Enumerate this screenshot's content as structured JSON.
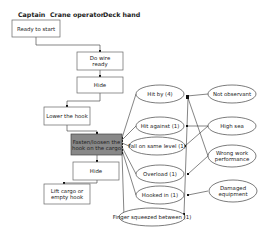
{
  "roles": [
    {
      "label": "Captain",
      "x": 18,
      "y": 17
    },
    {
      "label": "Crane operator",
      "x": 50,
      "y": 17
    },
    {
      "label": "Deck hand",
      "x": 103,
      "y": 17
    }
  ],
  "steps": [
    {
      "id": "ready",
      "lines": [
        "Ready to start"
      ],
      "x": 12,
      "y": 20,
      "w": 48,
      "h": 17,
      "dark": false
    },
    {
      "id": "wire",
      "lines": [
        "Do wire",
        "ready"
      ],
      "x": 77,
      "y": 52,
      "w": 46,
      "h": 18,
      "dark": false
    },
    {
      "id": "hide1",
      "lines": [
        "Hide"
      ],
      "x": 77,
      "y": 77,
      "w": 46,
      "h": 16,
      "dark": false
    },
    {
      "id": "lower",
      "lines": [
        "Lower the hook"
      ],
      "x": 44,
      "y": 107,
      "w": 46,
      "h": 18,
      "dark": false
    },
    {
      "id": "fasten",
      "lines": [
        "Fasten/loosen the",
        "hook on the cargo"
      ],
      "x": 71,
      "y": 134,
      "w": 51,
      "h": 21,
      "dark": true
    },
    {
      "id": "hide2",
      "lines": [
        "Hide"
      ],
      "x": 73,
      "y": 162,
      "w": 46,
      "h": 18,
      "dark": false
    },
    {
      "id": "lift",
      "lines": [
        "Lift cargo or",
        "empty hook"
      ],
      "x": 44,
      "y": 184,
      "w": 46,
      "h": 20,
      "dark": false
    }
  ],
  "accidents": [
    {
      "id": "hitby",
      "label": "Hit by (4)",
      "cx": 160,
      "cy": 94,
      "rx": 24,
      "ry": 9
    },
    {
      "id": "hitagainst",
      "label": "Hit against (1)",
      "cx": 160,
      "cy": 126,
      "rx": 24,
      "ry": 9
    },
    {
      "id": "fall",
      "label": "Fall on same level (1)",
      "cx": 157,
      "cy": 146,
      "rx": 28,
      "ry": 9
    },
    {
      "id": "overload",
      "label": "Overload (1)",
      "cx": 160,
      "cy": 174,
      "rx": 24,
      "ry": 9
    },
    {
      "id": "hooked",
      "label": "Hooked in (1)",
      "cx": 160,
      "cy": 195,
      "rx": 24,
      "ry": 9
    },
    {
      "id": "finger",
      "label": "Finger squeezed between (1)",
      "cx": 152,
      "cy": 217,
      "rx": 33,
      "ry": 9
    }
  ],
  "causes": [
    {
      "id": "notobs",
      "lines": [
        "Not observant"
      ],
      "cx": 232,
      "cy": 94,
      "rx": 24,
      "ry": 9
    },
    {
      "id": "highsea",
      "lines": [
        "High sea"
      ],
      "cx": 232,
      "cy": 126,
      "rx": 24,
      "ry": 9
    },
    {
      "id": "wrongwork",
      "lines": [
        "Wrong work",
        "performance"
      ],
      "cx": 232,
      "cy": 156,
      "rx": 24,
      "ry": 11
    },
    {
      "id": "damaged",
      "lines": [
        "Damaged",
        "equipment"
      ],
      "cx": 233,
      "cy": 191,
      "rx": 24,
      "ry": 11
    }
  ]
}
